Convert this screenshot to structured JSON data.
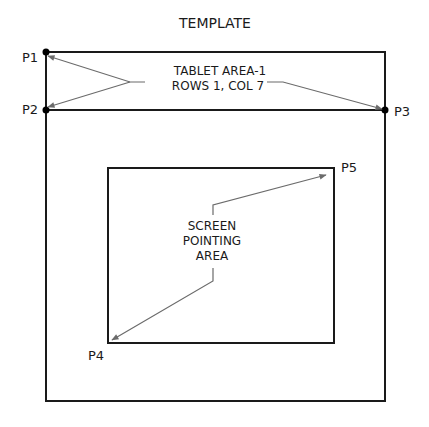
{
  "title": "TEMPLATE",
  "points": {
    "p1": "P1",
    "p2": "P2",
    "p3": "P3",
    "p4": "P4",
    "p5": "P5"
  },
  "tablet_area": {
    "line1": "TABLET AREA-1",
    "line2": "ROWS 1, COL 7"
  },
  "screen_area": {
    "line1": "SCREEN",
    "line2": "POINTING",
    "line3": "AREA"
  },
  "colors": {
    "outline": "#1a1a1a",
    "leader": "#6b6b6b",
    "background": "#ffffff"
  }
}
